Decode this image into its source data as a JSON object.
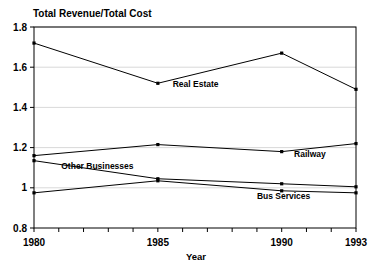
{
  "chart_data": {
    "type": "line",
    "title": "",
    "ylabel": "Total Revenue/Total Cost",
    "xlabel": "Year",
    "x": [
      1980,
      1985,
      1990,
      1993
    ],
    "xlim": [
      1980,
      1993
    ],
    "ylim": [
      0.8,
      1.8
    ],
    "grid": true,
    "legend_position": "inline-annotations",
    "x_tick_values": [
      1980,
      1981,
      1982,
      1983,
      1984,
      1985,
      1986,
      1987,
      1988,
      1989,
      1990,
      1991,
      1992,
      1993
    ],
    "x_tick_labels": [
      "1980",
      "",
      "",
      "",
      "",
      "1985",
      "",
      "",
      "",
      "",
      "1990",
      "",
      "",
      "1993"
    ],
    "y_tick_values": [
      0.8,
      1.0,
      1.2,
      1.4,
      1.6,
      1.8
    ],
    "y_tick_labels": [
      "0.8",
      "1",
      "1.2",
      "1.4",
      "1.6",
      "1.8"
    ],
    "series": [
      {
        "name": "Real Estate",
        "values": [
          1.72,
          1.52,
          1.67,
          1.49
        ],
        "label_x": 1985.6,
        "label_y": 1.5
      },
      {
        "name": "Railway",
        "values": [
          1.16,
          1.215,
          1.18,
          1.22
        ],
        "label_x": 1990.5,
        "label_y": 1.155
      },
      {
        "name": "Other Businesses",
        "values": [
          1.135,
          1.045,
          1.02,
          1.005
        ],
        "label_x": 1981.1,
        "label_y": 1.095
      },
      {
        "name": "Bus Services",
        "values": [
          0.975,
          1.035,
          0.985,
          0.975
        ],
        "label_x": 1989.0,
        "label_y": 0.945
      }
    ]
  },
  "colors": {
    "line": "#000000",
    "grid": "#c9c9c9",
    "axis": "#000000",
    "background": "#ffffff"
  }
}
